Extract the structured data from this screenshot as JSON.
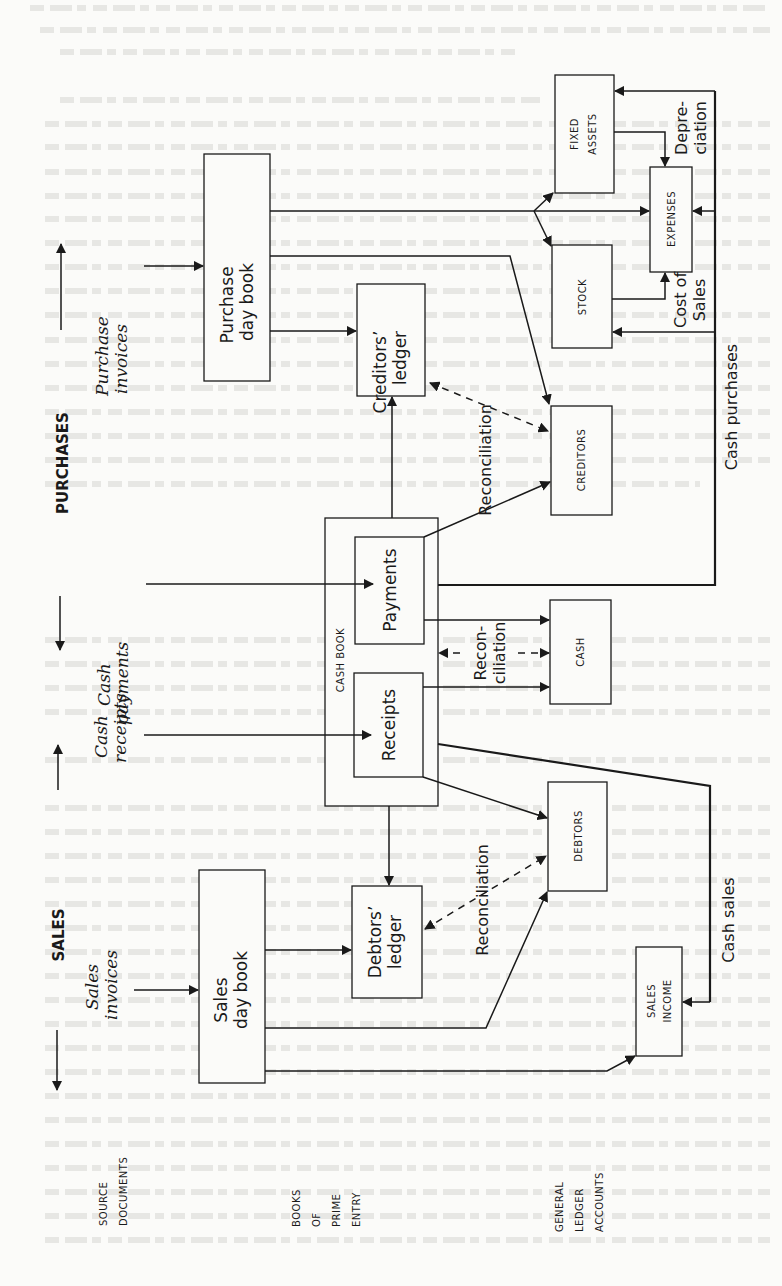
{
  "figure": {
    "orientation": "rotated-90-ccw",
    "axes": {
      "purchases_label": "PURCHASES",
      "sales_label": "SALES"
    },
    "column_labels": {
      "source_documents": [
        "SOURCE",
        "DOCUMENTS"
      ],
      "books_of_prime_entry": [
        "BOOKS",
        "OF",
        "PRIME",
        "ENTRY"
      ],
      "general_ledger_accounts": [
        "GENERAL",
        "LEDGER",
        "ACCOUNTS"
      ]
    },
    "source_documents": {
      "purchase_invoices": [
        "Purchase",
        "invoices"
      ],
      "cash_payments": [
        "Cash",
        "payments"
      ],
      "cash_receipts": [
        "Cash",
        "receipts"
      ],
      "sales_invoices": [
        "Sales",
        "invoices"
      ]
    },
    "books": {
      "purchase_day_book": [
        "Purchase",
        "day book"
      ],
      "creditors_ledger": [
        "Creditors’",
        "ledger"
      ],
      "cash_book": "CASH BOOK",
      "payments": "Payments",
      "receipts": "Receipts",
      "debtors_ledger": [
        "Debtors’",
        "ledger"
      ],
      "sales_day_book": [
        "Sales",
        "day book"
      ]
    },
    "ledger_accounts": {
      "fixed_assets": [
        "FIXED",
        "ASSETS"
      ],
      "expenses": "EXPENSES",
      "stock": "STOCK",
      "creditors": "CREDITORS",
      "cash": "CASH",
      "debtors": "DEBTORS",
      "sales_income": [
        "SALES",
        "INCOME"
      ]
    },
    "flow_labels": {
      "reconciliation_creditors": "Reconciliation",
      "reconciliation_cash": [
        "Recon-",
        "ciliation"
      ],
      "reconciliation_debtors": "Reconciliation",
      "depreciation": [
        "Depre-",
        "ciation"
      ],
      "cost_of_sales": [
        "Cost of",
        "Sales"
      ],
      "cash_purchases": "Cash purchases",
      "cash_sales": "Cash sales"
    }
  }
}
